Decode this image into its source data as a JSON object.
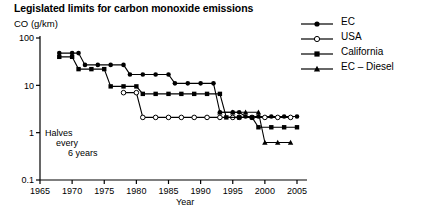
{
  "chart_data": {
    "type": "line",
    "title": "Legislated limits for carbon monoxide emissions",
    "ylabel": "CO (g/km)",
    "xlabel": "Year",
    "xlim": [
      1965,
      2005
    ],
    "ylim": [
      0.1,
      100
    ],
    "yscale": "log",
    "xticks": [
      1965,
      1970,
      1975,
      1980,
      1985,
      1990,
      1995,
      2000,
      2005
    ],
    "yticks": [
      0.1,
      1,
      10,
      100
    ],
    "grid": false,
    "legend_position": "top-right",
    "annotations": [
      {
        "text": "Halves",
        "x": 1967,
        "y": 0.85
      },
      {
        "text": "every",
        "x": 1969,
        "y": 0.62
      },
      {
        "text": "6 years",
        "x": 1971,
        "y": 0.46
      }
    ],
    "series": [
      {
        "name": "EC",
        "marker": "filled-circle",
        "points": [
          [
            1968,
            48
          ],
          [
            1970,
            48
          ],
          [
            1971,
            48
          ],
          [
            1972,
            27
          ],
          [
            1974,
            27
          ],
          [
            1976,
            27
          ],
          [
            1978,
            27
          ],
          [
            1979,
            17
          ],
          [
            1981,
            17
          ],
          [
            1983,
            17
          ],
          [
            1985,
            17
          ],
          [
            1986,
            11
          ],
          [
            1988,
            11
          ],
          [
            1990,
            11
          ],
          [
            1992,
            11
          ],
          [
            1993,
            2.7
          ],
          [
            1995,
            2.7
          ],
          [
            1996,
            2.7
          ],
          [
            1997,
            2.2
          ],
          [
            1999,
            2.2
          ],
          [
            2001,
            2.2
          ],
          [
            2003,
            2.2
          ],
          [
            2005,
            2.2
          ]
        ]
      },
      {
        "name": "USA",
        "marker": "open-circle",
        "points": [
          [
            1978,
            7.0
          ],
          [
            1980,
            7.0
          ],
          [
            1981,
            2.1
          ],
          [
            1983,
            2.1
          ],
          [
            1985,
            2.1
          ],
          [
            1987,
            2.1
          ],
          [
            1989,
            2.1
          ],
          [
            1991,
            2.1
          ],
          [
            1993,
            2.1
          ],
          [
            1995,
            2.1
          ],
          [
            1996,
            2.1
          ],
          [
            1998,
            2.1
          ],
          [
            2000,
            2.1
          ],
          [
            2002,
            2.1
          ],
          [
            2004,
            2.1
          ]
        ]
      },
      {
        "name": "California",
        "marker": "filled-square",
        "points": [
          [
            1968,
            40
          ],
          [
            1970,
            40
          ],
          [
            1971,
            22
          ],
          [
            1973,
            22
          ],
          [
            1975,
            22
          ],
          [
            1976,
            9.5
          ],
          [
            1978,
            9.5
          ],
          [
            1980,
            9.5
          ],
          [
            1981,
            6.6
          ],
          [
            1983,
            6.6
          ],
          [
            1985,
            6.6
          ],
          [
            1987,
            6.6
          ],
          [
            1989,
            6.6
          ],
          [
            1991,
            6.6
          ],
          [
            1993,
            6.6
          ],
          [
            1994,
            2.1
          ],
          [
            1996,
            2.1
          ],
          [
            1998,
            2.1
          ],
          [
            1999,
            1.3
          ],
          [
            2001,
            1.3
          ],
          [
            2003,
            1.3
          ],
          [
            2005,
            1.3
          ]
        ]
      },
      {
        "name": "EC – Diesel",
        "marker": "filled-triangle",
        "points": [
          [
            1993,
            2.7
          ],
          [
            1995,
            2.7
          ],
          [
            1997,
            2.7
          ],
          [
            1999,
            2.7
          ],
          [
            2000,
            0.62
          ],
          [
            2002,
            0.62
          ],
          [
            2004,
            0.62
          ]
        ]
      }
    ]
  },
  "legend": {
    "items": [
      {
        "label": "EC",
        "marker": "filled-circle"
      },
      {
        "label": "USA",
        "marker": "open-circle"
      },
      {
        "label": "California",
        "marker": "filled-square"
      },
      {
        "label": "EC – Diesel",
        "marker": "filled-triangle"
      }
    ]
  }
}
